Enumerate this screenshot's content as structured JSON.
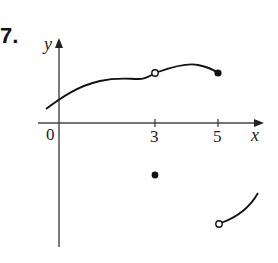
{
  "problem": {
    "number": "7."
  },
  "axes": {
    "x_label": "x",
    "y_label": "y",
    "origin_label": "0",
    "x_ticks": [
      {
        "value": 3,
        "label": "3"
      },
      {
        "value": 5,
        "label": "5"
      }
    ]
  },
  "graph": {
    "description": "Piecewise function with discontinuities at x=3 and x=5",
    "pieces": [
      {
        "name": "left-curve",
        "from_x": -0.5,
        "to_x": 5,
        "open_at": 3,
        "closed_end": 5
      },
      {
        "name": "isolated-point",
        "x": 3,
        "type": "filled"
      },
      {
        "name": "right-curve",
        "from_x": 5,
        "type_start": "open"
      }
    ]
  },
  "colors": {
    "ink": "#111111",
    "axis": "#444444",
    "background": "#ffffff"
  }
}
